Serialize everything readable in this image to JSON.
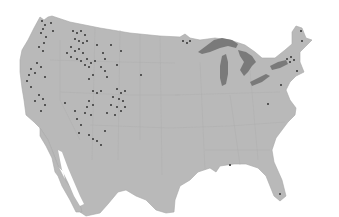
{
  "map": {
    "region": "Contiguous United States with northern Mexico",
    "colors": {
      "background": "#ffffff",
      "land": "#b9b9b9",
      "land_border": "#a8a8a8",
      "water": "#7a7a7a",
      "marker": "#555555"
    },
    "legend": null,
    "marker_clusters": [
      {
        "name": "pacific-northwest-coast",
        "cx": 42,
        "cy": 40
      },
      {
        "name": "northern-rockies",
        "cx": 80,
        "cy": 55
      },
      {
        "name": "western-montana",
        "cx": 105,
        "cy": 65
      },
      {
        "name": "california-sierra",
        "cx": 40,
        "cy": 95
      },
      {
        "name": "colorado-plateau",
        "cx": 100,
        "cy": 105
      },
      {
        "name": "southern-rockies",
        "cx": 120,
        "cy": 100
      },
      {
        "name": "arizona",
        "cx": 95,
        "cy": 140
      },
      {
        "name": "adirondacks",
        "cx": 290,
        "cy": 60
      },
      {
        "name": "minnesota-north",
        "cx": 185,
        "cy": 42
      }
    ]
  }
}
